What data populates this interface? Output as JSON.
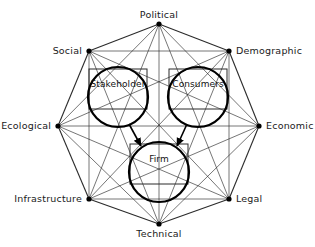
{
  "diagram": {
    "type": "network-octagon",
    "environment_nodes": [
      {
        "id": "political",
        "label": "Political",
        "x": 159,
        "y": 24,
        "label_x": 159,
        "label_y": 10,
        "anchor": "center"
      },
      {
        "id": "demographic",
        "label": "Demographic",
        "x": 229,
        "y": 51,
        "label_x": 236,
        "label_y": 46,
        "anchor": "left"
      },
      {
        "id": "economic",
        "label": "Economic",
        "x": 259,
        "y": 126,
        "label_x": 266,
        "label_y": 121,
        "anchor": "left"
      },
      {
        "id": "legal",
        "label": "Legal",
        "x": 229,
        "y": 199,
        "label_x": 236,
        "label_y": 194,
        "anchor": "left"
      },
      {
        "id": "technical",
        "label": "Technical",
        "x": 159,
        "y": 224,
        "label_x": 159,
        "label_y": 229,
        "anchor": "center"
      },
      {
        "id": "infrastructure",
        "label": "Infrastructure",
        "x": 89,
        "y": 199,
        "label_x": 82,
        "label_y": 194,
        "anchor": "right"
      },
      {
        "id": "ecological",
        "label": "Ecological",
        "x": 58,
        "y": 126,
        "label_x": 51,
        "label_y": 121,
        "anchor": "right"
      },
      {
        "id": "social",
        "label": "Social",
        "x": 89,
        "y": 51,
        "label_x": 82,
        "label_y": 46,
        "anchor": "right"
      }
    ],
    "actor_circles": [
      {
        "id": "stakeholder",
        "label": "Stakeholder",
        "cx": 118,
        "cy": 97,
        "r": 30,
        "box_w": 58,
        "box_h": 40,
        "label_dy": -13
      },
      {
        "id": "consumers",
        "label": "Consumers",
        "cx": 198,
        "cy": 97,
        "r": 30,
        "box_w": 58,
        "box_h": 40,
        "label_dy": -13
      },
      {
        "id": "firm",
        "label": "Firm",
        "cx": 159,
        "cy": 172,
        "r": 30,
        "box_w": 58,
        "box_h": 40,
        "label_dy": -13
      }
    ],
    "arrows": [
      {
        "id": "stakeholder-to-firm",
        "from": "stakeholder",
        "to": "firm",
        "x1": 129,
        "y1": 124,
        "x2": 141,
        "y2": 146
      },
      {
        "id": "consumers-to-firm",
        "from": "consumers",
        "to": "firm",
        "x1": 187,
        "y1": 124,
        "x2": 177,
        "y2": 146
      }
    ],
    "style": {
      "line_color": "#2b2b2b",
      "circle_color": "#000000",
      "node_dot_color": "#000000",
      "background": "#ffffff",
      "text_color": "#1a1a1a"
    },
    "notes": {
      "connectivity": "complete-graph-all-pairs",
      "node_count": 8,
      "edge_count": 28
    }
  }
}
